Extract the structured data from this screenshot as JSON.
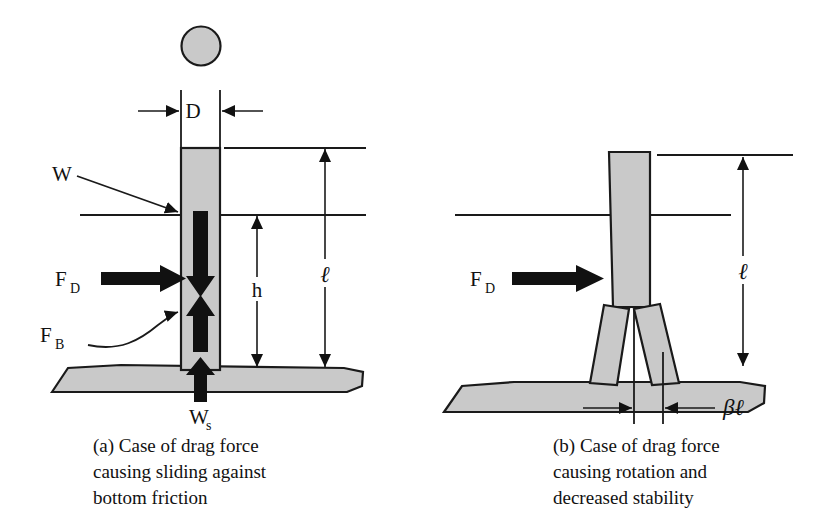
{
  "figure": {
    "kind": "engineering-free-body-diagram",
    "background_color": "#ffffff",
    "line_color": "#1a1a1a",
    "fill_color": "#c9c9c9",
    "arrow_color": "#111111"
  },
  "panel_a": {
    "id": "a",
    "caption_lines": [
      "(a) Case of drag force",
      "causing sliding against",
      "bottom friction"
    ],
    "labels": {
      "diameter": "D",
      "weight": "W",
      "drag_force": "F",
      "drag_force_sub": "D",
      "buoyancy_force": "F",
      "buoyancy_force_sub": "B",
      "soil_reaction": "W",
      "soil_reaction_sub": "s",
      "height_above_bed": "h",
      "length": "ℓ"
    },
    "elements": [
      "top-circle-plan-view",
      "diameter-dimension",
      "vertical-column",
      "water-surface-line",
      "top-reference-line",
      "seabed",
      "weight-arrow-down",
      "buoyancy-arrow-up",
      "drag-arrow-right",
      "soil-reaction-arrow-up",
      "h-dimension-arrow",
      "ell-dimension-arrow"
    ]
  },
  "panel_b": {
    "id": "b",
    "caption_lines": [
      "(b) Case of drag force",
      "causing rotation and",
      "decreased stability"
    ],
    "labels": {
      "drag_force": "F",
      "drag_force_sub": "D",
      "length": "ℓ",
      "offset": "βℓ"
    },
    "elements": [
      "vertical-column",
      "splayed-leg-left",
      "splayed-leg-right",
      "water-surface-line",
      "top-reference-line",
      "seabed",
      "drag-arrow-right",
      "ell-dimension-arrow",
      "beta-ell-dimension"
    ]
  }
}
